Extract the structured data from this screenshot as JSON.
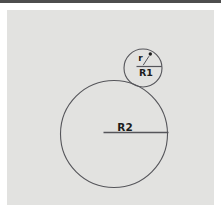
{
  "window": {
    "top_bar_color": "#4e4e4e"
  },
  "figure": {
    "panel_color": "#e2e2e0",
    "stroke_color": "#55555a",
    "text_color": "#1c1c1c",
    "large_circle": {
      "cx": 114,
      "cy": 134,
      "r": 53.5,
      "radius_label": "R2"
    },
    "small_circle": {
      "cx": 143,
      "cy": 68,
      "r": 19,
      "radius_label": "R1",
      "point_label": "r"
    }
  }
}
